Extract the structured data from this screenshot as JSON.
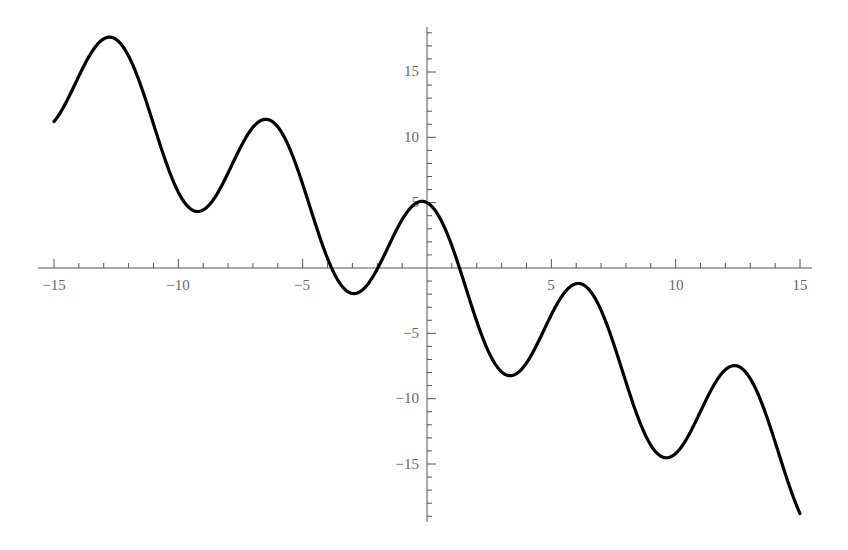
{
  "chart_data": {
    "type": "line",
    "title": "",
    "xlabel": "",
    "ylabel": "",
    "function": "y = 5 cos(x) - x",
    "xlim": [
      -15,
      15
    ],
    "ylim": [
      -19,
      19
    ],
    "grid": false,
    "legend": null,
    "x_major_ticks": [
      -15,
      -10,
      -5,
      5,
      10,
      15
    ],
    "x_tick_labels": [
      "−15",
      "−10",
      "−5",
      "5",
      "10",
      "15"
    ],
    "y_major_ticks": [
      15,
      10,
      5,
      -5,
      -10,
      -15
    ],
    "y_tick_labels": [
      "15",
      "10",
      "5",
      "−5",
      "−10",
      "−15"
    ],
    "minor_tick_step": 1,
    "series": [
      {
        "name": "5cos(x) - x",
        "color": "#000000",
        "x": [
          -15,
          -14,
          -13,
          -12.76,
          -12,
          -11,
          -10,
          -9.4,
          -9,
          -8,
          -7,
          -6.5,
          -6,
          -5,
          -4,
          -3.5,
          -3,
          -2.8,
          -2,
          -1,
          -0.2,
          0,
          1,
          2,
          3,
          3.3,
          4,
          5,
          6,
          6.1,
          7,
          8,
          9,
          9.6,
          10,
          11,
          12,
          12.4,
          13,
          14,
          15
        ],
        "y": [
          11.2,
          13.8,
          17.6,
          17.7,
          16.2,
          11.0,
          5.8,
          4.4,
          4.4,
          7.3,
          10.8,
          11.3,
          10.8,
          6.4,
          0.7,
          -0.2,
          -1.9,
          -1.9,
          -0.1,
          3.7,
          5.1,
          5.0,
          1.7,
          -4.1,
          -7.9,
          -8.2,
          -7.3,
          -3.6,
          -1.2,
          -1.1,
          -3.2,
          -8.7,
          -13.6,
          -14.9,
          -14.2,
          -11.0,
          -7.8,
          -7.5,
          -8.5,
          -13.3,
          -18.8
        ]
      }
    ]
  }
}
